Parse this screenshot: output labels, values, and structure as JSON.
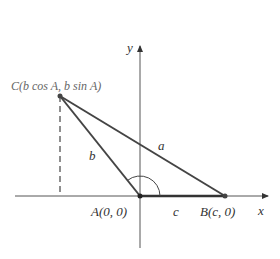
{
  "diagram": {
    "axes": {
      "x_label": "x",
      "y_label": "y"
    },
    "points": {
      "A": {
        "label": "A(0, 0)"
      },
      "B": {
        "label": "B(c, 0)"
      },
      "C": {
        "label": "C(b cos A, b sin A)"
      }
    },
    "sides": {
      "a": "a",
      "b": "b",
      "c": "c"
    },
    "colors": {
      "line": "#444444",
      "axis": "#555555",
      "label_c": "#777777"
    }
  }
}
